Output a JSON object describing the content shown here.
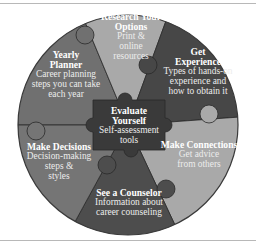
{
  "diagram": {
    "colors": {
      "dark": "#474747",
      "medium": "#707070",
      "light": "#a9a9a9",
      "center": "#3a3a3a",
      "outline": "#2a2a2a"
    },
    "center": {
      "title_line1": "Evaluate",
      "title_line2": "Yourself",
      "desc": "Self-assessment tools"
    },
    "segments": [
      {
        "id": "research",
        "title_line1": "Research Your",
        "title_line2": "Options",
        "desc_line1": "Print &",
        "desc_line2": "online",
        "desc_line3": "resources"
      },
      {
        "id": "experience",
        "title_line1": "Get",
        "title_line2": "Experience",
        "desc_line1": "Types of hands-on",
        "desc_line2": "experience and",
        "desc_line3": "how to obtain it"
      },
      {
        "id": "connections",
        "title_line1": "Make Connections",
        "desc_line1": "Get advice",
        "desc_line2": "from others"
      },
      {
        "id": "counselor",
        "title_line1": "See a Counselor",
        "desc_line1": "Information about",
        "desc_line2": "career counseling"
      },
      {
        "id": "decisions",
        "title_line1": "Make Decisions",
        "desc_line1": "Decision-making",
        "desc_line2": "steps &",
        "desc_line3": "styles"
      },
      {
        "id": "planner",
        "title_line1": "Yearly",
        "title_line2": "Planner",
        "desc_line1": "Career planning",
        "desc_line2": "steps you can take",
        "desc_line3": "each year"
      }
    ]
  }
}
